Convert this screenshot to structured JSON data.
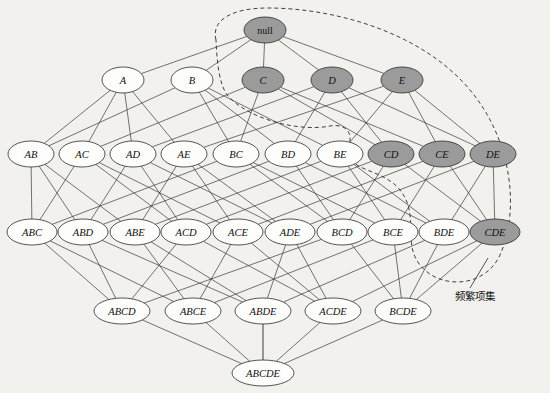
{
  "figure": {
    "background_color": "#f2f1ee",
    "shaded_fill": "#9b9b9b",
    "plain_fill": "#fdfdfb",
    "edge_color": "#3a3a3a",
    "boundary_style": "dashed"
  },
  "annotation": {
    "label": "频繁项集",
    "x": 455,
    "y": 296
  },
  "levels": [
    {
      "index": 0,
      "y": 30,
      "nodes": [
        {
          "id": "null",
          "label": "null",
          "x": 265,
          "shaded": true,
          "rx": 21,
          "ry": 13,
          "root": true
        }
      ]
    },
    {
      "index": 1,
      "y": 80,
      "nodes": [
        {
          "id": "A",
          "label": "A",
          "x": 123,
          "shaded": false,
          "rx": 21,
          "ry": 13
        },
        {
          "id": "B",
          "label": "B",
          "x": 192,
          "shaded": false,
          "rx": 21,
          "ry": 13
        },
        {
          "id": "C",
          "label": "C",
          "x": 263,
          "shaded": true,
          "rx": 21,
          "ry": 13
        },
        {
          "id": "D",
          "label": "D",
          "x": 332,
          "shaded": true,
          "rx": 21,
          "ry": 13
        },
        {
          "id": "E",
          "label": "E",
          "x": 402,
          "shaded": true,
          "rx": 21,
          "ry": 13
        }
      ]
    },
    {
      "index": 2,
      "y": 154,
      "nodes": [
        {
          "id": "AB",
          "label": "AB",
          "x": 31,
          "shaded": false,
          "rx": 23,
          "ry": 13
        },
        {
          "id": "AC",
          "label": "AC",
          "x": 82,
          "shaded": false,
          "rx": 23,
          "ry": 13
        },
        {
          "id": "AD",
          "label": "AD",
          "x": 133,
          "shaded": false,
          "rx": 23,
          "ry": 13
        },
        {
          "id": "AE",
          "label": "AE",
          "x": 184,
          "shaded": false,
          "rx": 23,
          "ry": 13
        },
        {
          "id": "BC",
          "label": "BC",
          "x": 236,
          "shaded": false,
          "rx": 23,
          "ry": 13
        },
        {
          "id": "BD",
          "label": "BD",
          "x": 288,
          "shaded": false,
          "rx": 23,
          "ry": 13
        },
        {
          "id": "BE",
          "label": "BE",
          "x": 340,
          "shaded": false,
          "rx": 23,
          "ry": 13
        },
        {
          "id": "CD",
          "label": "CD",
          "x": 391,
          "shaded": true,
          "rx": 23,
          "ry": 13
        },
        {
          "id": "CE",
          "label": "CE",
          "x": 442,
          "shaded": true,
          "rx": 23,
          "ry": 13
        },
        {
          "id": "DE",
          "label": "DE",
          "x": 493,
          "shaded": true,
          "rx": 23,
          "ry": 13
        }
      ]
    },
    {
      "index": 3,
      "y": 232,
      "nodes": [
        {
          "id": "ABC",
          "label": "ABC",
          "x": 32,
          "shaded": false,
          "rx": 25,
          "ry": 13
        },
        {
          "id": "ABD",
          "label": "ABD",
          "x": 83,
          "shaded": false,
          "rx": 25,
          "ry": 13
        },
        {
          "id": "ABE",
          "label": "ABE",
          "x": 135,
          "shaded": false,
          "rx": 25,
          "ry": 13
        },
        {
          "id": "ACD",
          "label": "ACD",
          "x": 186,
          "shaded": false,
          "rx": 25,
          "ry": 13
        },
        {
          "id": "ACE",
          "label": "ACE",
          "x": 238,
          "shaded": false,
          "rx": 25,
          "ry": 13
        },
        {
          "id": "ADE",
          "label": "ADE",
          "x": 290,
          "shaded": false,
          "rx": 25,
          "ry": 13
        },
        {
          "id": "BCD",
          "label": "BCD",
          "x": 342,
          "shaded": false,
          "rx": 25,
          "ry": 13
        },
        {
          "id": "BCE",
          "label": "BCE",
          "x": 393,
          "shaded": false,
          "rx": 25,
          "ry": 13
        },
        {
          "id": "BDE",
          "label": "BDE",
          "x": 444,
          "shaded": false,
          "rx": 25,
          "ry": 13
        },
        {
          "id": "CDE",
          "label": "CDE",
          "x": 495,
          "shaded": true,
          "rx": 25,
          "ry": 13
        }
      ]
    },
    {
      "index": 4,
      "y": 311,
      "nodes": [
        {
          "id": "ABCD",
          "label": "ABCD",
          "x": 122,
          "shaded": false,
          "rx": 28,
          "ry": 13
        },
        {
          "id": "ABCE",
          "label": "ABCE",
          "x": 193,
          "shaded": false,
          "rx": 28,
          "ry": 13
        },
        {
          "id": "ABDE",
          "label": "ABDE",
          "x": 263,
          "shaded": false,
          "rx": 28,
          "ry": 13
        },
        {
          "id": "ACDE",
          "label": "ACDE",
          "x": 333,
          "shaded": false,
          "rx": 28,
          "ry": 13
        },
        {
          "id": "BCDE",
          "label": "BCDE",
          "x": 403,
          "shaded": false,
          "rx": 28,
          "ry": 13
        }
      ]
    },
    {
      "index": 5,
      "y": 373,
      "nodes": [
        {
          "id": "ABCDE",
          "label": "ABCDE",
          "x": 263,
          "shaded": false,
          "rx": 31,
          "ry": 13
        }
      ]
    }
  ],
  "edges": [
    [
      "null",
      "A"
    ],
    [
      "null",
      "B"
    ],
    [
      "null",
      "C"
    ],
    [
      "null",
      "D"
    ],
    [
      "null",
      "E"
    ],
    [
      "A",
      "AB"
    ],
    [
      "A",
      "AC"
    ],
    [
      "A",
      "AD"
    ],
    [
      "A",
      "AE"
    ],
    [
      "B",
      "AB"
    ],
    [
      "B",
      "BC"
    ],
    [
      "B",
      "BD"
    ],
    [
      "B",
      "BE"
    ],
    [
      "C",
      "AC"
    ],
    [
      "C",
      "BC"
    ],
    [
      "C",
      "CD"
    ],
    [
      "C",
      "CE"
    ],
    [
      "D",
      "AD"
    ],
    [
      "D",
      "BD"
    ],
    [
      "D",
      "CD"
    ],
    [
      "D",
      "DE"
    ],
    [
      "E",
      "AE"
    ],
    [
      "E",
      "BE"
    ],
    [
      "E",
      "CE"
    ],
    [
      "E",
      "DE"
    ],
    [
      "AB",
      "ABC"
    ],
    [
      "AB",
      "ABD"
    ],
    [
      "AB",
      "ABE"
    ],
    [
      "AC",
      "ABC"
    ],
    [
      "AC",
      "ACD"
    ],
    [
      "AC",
      "ACE"
    ],
    [
      "AD",
      "ABD"
    ],
    [
      "AD",
      "ACD"
    ],
    [
      "AD",
      "ADE"
    ],
    [
      "AE",
      "ABE"
    ],
    [
      "AE",
      "ACE"
    ],
    [
      "AE",
      "ADE"
    ],
    [
      "BC",
      "ABC"
    ],
    [
      "BC",
      "BCD"
    ],
    [
      "BC",
      "BCE"
    ],
    [
      "BD",
      "ABD"
    ],
    [
      "BD",
      "BCD"
    ],
    [
      "BD",
      "BDE"
    ],
    [
      "BE",
      "ABE"
    ],
    [
      "BE",
      "BCE"
    ],
    [
      "BE",
      "BDE"
    ],
    [
      "CD",
      "ACD"
    ],
    [
      "CD",
      "BCD"
    ],
    [
      "CD",
      "CDE"
    ],
    [
      "CE",
      "ACE"
    ],
    [
      "CE",
      "BCE"
    ],
    [
      "CE",
      "CDE"
    ],
    [
      "DE",
      "ADE"
    ],
    [
      "DE",
      "BDE"
    ],
    [
      "DE",
      "CDE"
    ],
    [
      "ABC",
      "ABCD"
    ],
    [
      "ABC",
      "ABCE"
    ],
    [
      "ABD",
      "ABCD"
    ],
    [
      "ABD",
      "ABDE"
    ],
    [
      "ABE",
      "ABCE"
    ],
    [
      "ABE",
      "ABDE"
    ],
    [
      "ACD",
      "ABCD"
    ],
    [
      "ACD",
      "ACDE"
    ],
    [
      "ACE",
      "ABCE"
    ],
    [
      "ACE",
      "ACDE"
    ],
    [
      "ADE",
      "ABDE"
    ],
    [
      "ADE",
      "ACDE"
    ],
    [
      "BCD",
      "ABCD"
    ],
    [
      "BCD",
      "BCDE"
    ],
    [
      "BCE",
      "ABCE"
    ],
    [
      "BCE",
      "BCDE"
    ],
    [
      "BDE",
      "ABDE"
    ],
    [
      "BDE",
      "BCDE"
    ],
    [
      "CDE",
      "ACDE"
    ],
    [
      "CDE",
      "BCDE"
    ],
    [
      "ABCD",
      "ABCDE"
    ],
    [
      "ABCE",
      "ABCDE"
    ],
    [
      "ABDE",
      "ABCDE"
    ],
    [
      "ACDE",
      "ABCDE"
    ],
    [
      "BCDE",
      "ABCDE"
    ]
  ],
  "boundary_path": "M 216 40 C 211 20, 232 8, 268 8 C 330 8, 420 30, 470 90 C 512 140, 520 210, 500 255 C 485 288, 440 290, 420 265 C 402 243, 420 215, 400 190 C 388 175, 368 172, 357 165 C 348 158, 350 145, 350 138 C 350 128, 340 124, 330 126 C 300 132, 250 120, 228 96 C 219 85, 217 62, 216 40",
  "leader_line": {
    "x1": 470,
    "y1": 288,
    "x2": 488,
    "y2": 258
  }
}
